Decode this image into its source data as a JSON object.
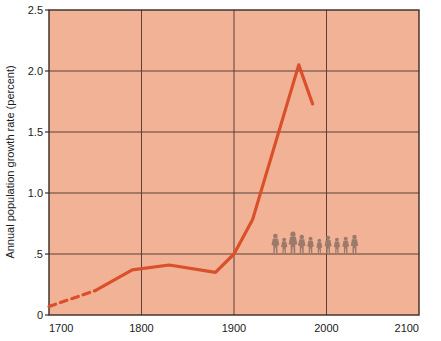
{
  "chart_data": {
    "type": "line",
    "title": "",
    "xlabel": "",
    "ylabel": "Annual population growth rate (percent)",
    "xlim": [
      1700,
      2100
    ],
    "ylim": [
      0,
      2.5
    ],
    "grid": true,
    "legend": "none",
    "plot_background_color": "#f2b296",
    "line_color": "#d9502a",
    "gridline_color": "#5a4038",
    "axis_color": "#3b2a24",
    "x_ticks": [
      1700,
      1800,
      1900,
      2000,
      2100
    ],
    "x_tick_labels": [
      "1700",
      "1800",
      "1900",
      "2000",
      "2100"
    ],
    "y_ticks": [
      0,
      0.5,
      1.0,
      1.5,
      2.0,
      2.5
    ],
    "y_tick_labels": [
      "0",
      ".5",
      "1.0",
      "1.5",
      "2.0",
      "2.5"
    ],
    "series": [
      {
        "name": "Annual population growth rate",
        "style": "dashed",
        "segment": "estimated",
        "x": [
          1700,
          1750
        ],
        "values": [
          0.07,
          0.2
        ]
      },
      {
        "name": "Annual population growth rate",
        "style": "solid",
        "segment": "observed",
        "x": [
          1750,
          1790,
          1830,
          1880,
          1900,
          1920,
          1970,
          1985
        ],
        "values": [
          0.2,
          0.37,
          0.41,
          0.35,
          0.5,
          0.78,
          2.05,
          1.73
        ]
      }
    ],
    "annotations": [
      {
        "name": "people-figures",
        "type": "pictogram-row",
        "description": "row of human silhouette figures",
        "count": 10,
        "color": "#9c7a6b",
        "x_range": [
          1940,
          2035
        ],
        "baseline_value": 0.5
      }
    ]
  }
}
